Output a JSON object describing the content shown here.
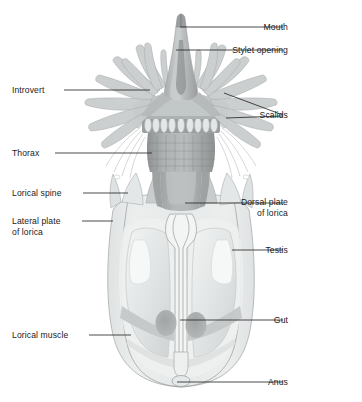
{
  "figure": {
    "name": "loriciferan-anatomy-diagram",
    "organism": "Loriciferan (ventral view)",
    "background_color": "#ffffff",
    "label_color": "#1b1b1b",
    "leader_color": "#2a2a2a",
    "palette": {
      "body_pale": "#e8eaea",
      "body_pale_2": "#dfe2e2",
      "lorica_fill": "#e3e6e6",
      "plate_mid": "#c9cccc",
      "plate_dark": "#9fa3a3",
      "thorax_dark": "#8e9292",
      "introvert_mid": "#b9bdbd",
      "scalid_fill": "#c6cac9",
      "scalid_stroke": "#a7abab",
      "gut_dark": "#a9adad",
      "muscle_band": "#c0c4c4",
      "mouth_cone": "#b5b9b9",
      "outline_stroke": "#9a9a9a"
    }
  },
  "labels": {
    "left": [
      {
        "id": "introvert",
        "text": "Introvert",
        "text2": "",
        "x": 12,
        "y": 93,
        "line_x1": 64,
        "line_y1": 90,
        "line_x2": 150,
        "line_y2": 90
      },
      {
        "id": "thorax",
        "text": "Thorax",
        "text2": "",
        "x": 12,
        "y": 156,
        "line_x1": 55,
        "line_y1": 153,
        "line_x2": 152,
        "line_y2": 153
      },
      {
        "id": "lorical-spine",
        "text": "Lorical spine",
        "text2": "",
        "x": 12,
        "y": 196,
        "line_x1": 83,
        "line_y1": 193,
        "line_x2": 128,
        "line_y2": 193
      },
      {
        "id": "lateral-plate",
        "text": "Lateral plate",
        "text2": "of lorica",
        "x": 12,
        "y": 224,
        "line_x1": 82,
        "line_y1": 221,
        "line_x2": 113,
        "line_y2": 221
      },
      {
        "id": "lorical-muscle",
        "text": "Lorical muscle",
        "text2": "",
        "x": 12,
        "y": 338,
        "line_x1": 89,
        "line_y1": 335,
        "line_x2": 131,
        "line_y2": 335
      }
    ],
    "right": [
      {
        "id": "mouth",
        "text": "Mouth",
        "text2": "",
        "x": 288,
        "y": 30,
        "line_x1": 180,
        "line_y1": 27,
        "line_x2": 283,
        "line_y2": 27
      },
      {
        "id": "stylet-opening",
        "text": "Stylet opening",
        "text2": "",
        "x": 288,
        "y": 53,
        "line_x1": 176,
        "line_y1": 50,
        "line_x2": 283,
        "line_y2": 50
      },
      {
        "id": "scalids",
        "text": "Scalids",
        "text2": "",
        "x": 288,
        "y": 118,
        "line_x1": 224,
        "line_y1": 93,
        "line_x2": 283,
        "line_y2": 115
      },
      {
        "id": "dorsal-plate",
        "text": "Dorsal plate",
        "text2": "of lorica",
        "x": 288,
        "y": 205,
        "line_x1": 185,
        "line_y1": 203,
        "line_x2": 283,
        "line_y2": 203
      },
      {
        "id": "testis",
        "text": "Testis",
        "text2": "",
        "x": 288,
        "y": 253,
        "line_x1": 232,
        "line_y1": 250,
        "line_x2": 283,
        "line_y2": 250
      },
      {
        "id": "gut",
        "text": "Gut",
        "text2": "",
        "x": 288,
        "y": 323,
        "line_x1": 180,
        "line_y1": 320,
        "line_x2": 283,
        "line_y2": 320
      },
      {
        "id": "anus",
        "text": "Anus",
        "text2": "",
        "x": 288,
        "y": 385,
        "line_x1": 177,
        "line_y1": 382,
        "line_x2": 283,
        "line_y2": 382
      }
    ],
    "scalids_extra_leader": {
      "line_x1": 226,
      "line_y1": 118,
      "line_x2": 283,
      "line_y2": 116
    }
  },
  "structures": {
    "mouth_cone": "mouth-cone",
    "introvert": "introvert",
    "scalids": "scalid-appendages",
    "thorax": "thorax-placids",
    "lorica": "lorica-body",
    "lorical_spines": "lorical-spines",
    "gut_tube": "gut-tube",
    "gonads": "testis-pair",
    "lorical_muscles": "lorical-muscle-bands",
    "anus": "anus-opening"
  }
}
